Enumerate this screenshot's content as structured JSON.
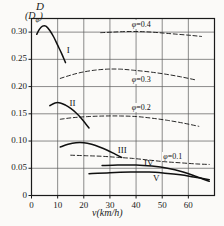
{
  "chart_data": {
    "type": "line",
    "title": "",
    "xlabel": "v(km/h)",
    "ylabel_top": "D",
    "ylabel_bottom": "(Dφ)",
    "xlim": [
      0,
      70
    ],
    "ylim": [
      0,
      0.325
    ],
    "grid": true,
    "legend": "inline-annotations",
    "xticks": [
      "0",
      "10",
      "20",
      "30",
      "40",
      "50",
      "60"
    ],
    "xtick_values": [
      0,
      10,
      20,
      30,
      40,
      50,
      60
    ],
    "yticks": [
      "0",
      "0.05",
      "0.10",
      "0.15",
      "0.20",
      "0.25",
      "0.30"
    ],
    "ytick_values": [
      0,
      0.05,
      0.1,
      0.15,
      0.2,
      0.25,
      0.3
    ],
    "series": [
      {
        "name": "I",
        "style": "solid",
        "label": "I",
        "points": [
          [
            2.0,
            0.296
          ],
          [
            3.0,
            0.305
          ],
          [
            4.2,
            0.311
          ],
          [
            5.5,
            0.311
          ],
          [
            7.0,
            0.303
          ],
          [
            8.5,
            0.291
          ],
          [
            10.0,
            0.276
          ],
          [
            11.5,
            0.261
          ],
          [
            13.0,
            0.244
          ]
        ]
      },
      {
        "name": "II",
        "style": "solid",
        "label": "II",
        "points": [
          [
            7.0,
            0.165
          ],
          [
            9.0,
            0.17
          ],
          [
            11.0,
            0.17
          ],
          [
            13.0,
            0.166
          ],
          [
            15.0,
            0.16
          ],
          [
            17.0,
            0.152
          ],
          [
            19.0,
            0.142
          ],
          [
            21.0,
            0.13
          ],
          [
            22.0,
            0.124
          ]
        ]
      },
      {
        "name": "III",
        "style": "solid",
        "label": "III",
        "points": [
          [
            11.0,
            0.089
          ],
          [
            14.0,
            0.094
          ],
          [
            17.0,
            0.097
          ],
          [
            20.0,
            0.097
          ],
          [
            23.0,
            0.094
          ],
          [
            26.0,
            0.089
          ],
          [
            29.0,
            0.083
          ],
          [
            32.0,
            0.076
          ],
          [
            34.5,
            0.07
          ]
        ]
      },
      {
        "name": "IV",
        "style": "solid",
        "label": "IV",
        "points": [
          [
            27.0,
            0.055
          ],
          [
            33.0,
            0.056
          ],
          [
            40.0,
            0.056
          ],
          [
            46.0,
            0.054
          ],
          [
            52.0,
            0.05
          ],
          [
            58.0,
            0.043
          ],
          [
            63.0,
            0.035
          ],
          [
            68.0,
            0.026
          ]
        ]
      },
      {
        "name": "V",
        "style": "solid",
        "label": "V",
        "points": [
          [
            22.0,
            0.04
          ],
          [
            30.0,
            0.042
          ],
          [
            38.0,
            0.043
          ],
          [
            45.0,
            0.043
          ],
          [
            51.0,
            0.041
          ],
          [
            57.0,
            0.038
          ],
          [
            62.0,
            0.034
          ],
          [
            68.0,
            0.029
          ]
        ]
      },
      {
        "name": "phi=0.4",
        "style": "dashed",
        "label": "φ=0.4",
        "points": [
          [
            26.5,
            0.299
          ],
          [
            31.0,
            0.3
          ],
          [
            36.0,
            0.301
          ],
          [
            41.0,
            0.301
          ],
          [
            46.0,
            0.3
          ],
          [
            51.0,
            0.298
          ],
          [
            56.0,
            0.296
          ],
          [
            61.0,
            0.294
          ],
          [
            65.0,
            0.292
          ]
        ]
      },
      {
        "name": "phi=0.3",
        "style": "dashed",
        "label": "φ=0.3",
        "points": [
          [
            11.0,
            0.215
          ],
          [
            15.0,
            0.221
          ],
          [
            19.0,
            0.226
          ],
          [
            24.0,
            0.23
          ],
          [
            29.0,
            0.232
          ],
          [
            34.0,
            0.232
          ],
          [
            39.0,
            0.23
          ],
          [
            45.0,
            0.227
          ],
          [
            51.0,
            0.223
          ],
          [
            57.0,
            0.218
          ],
          [
            63.0,
            0.212
          ]
        ]
      },
      {
        "name": "phi=0.2",
        "style": "dashed",
        "label": "φ=0.2",
        "points": [
          [
            11.0,
            0.14
          ],
          [
            16.0,
            0.143
          ],
          [
            22.0,
            0.145
          ],
          [
            28.0,
            0.146
          ],
          [
            34.0,
            0.146
          ],
          [
            40.0,
            0.145
          ],
          [
            46.0,
            0.142
          ],
          [
            52.0,
            0.138
          ],
          [
            58.0,
            0.133
          ],
          [
            64.0,
            0.127
          ]
        ]
      },
      {
        "name": "phi=0.1",
        "style": "dashed",
        "label": "φ=0.1",
        "points": [
          [
            15.0,
            0.074
          ],
          [
            21.0,
            0.073
          ],
          [
            27.0,
            0.072
          ],
          [
            33.0,
            0.07
          ],
          [
            39.0,
            0.068
          ],
          [
            45.0,
            0.065
          ],
          [
            51.0,
            0.062
          ],
          [
            57.0,
            0.06
          ],
          [
            63.0,
            0.058
          ],
          [
            68.0,
            0.057
          ]
        ]
      }
    ],
    "annotations": [
      {
        "text": "I",
        "x": 13.5,
        "y": 0.265
      },
      {
        "text": "II",
        "x": 14.5,
        "y": 0.168
      },
      {
        "text": "III",
        "x": 33.0,
        "y": 0.081
      },
      {
        "text": "IV",
        "x": 43.0,
        "y": 0.058
      },
      {
        "text": "V",
        "x": 46.5,
        "y": 0.03
      },
      {
        "text": "φ=0.4",
        "x": 38.0,
        "y": 0.312
      },
      {
        "text": "φ=0.3",
        "x": 38.0,
        "y": 0.211
      },
      {
        "text": "φ=0.2",
        "x": 38.0,
        "y": 0.158
      },
      {
        "text": "φ=0.1",
        "x": 50.0,
        "y": 0.069
      }
    ]
  },
  "axes": {
    "ylabel_top": "D",
    "ylabel_paren_open": "(D",
    "ylabel_sub": "φ",
    "ylabel_paren_close": ")",
    "xlabel": "v(km/h)"
  },
  "colors": {
    "background": "#fbfaf8",
    "axis": "#1a1a1a",
    "grid": "#5a5a5a",
    "curve": "#101010",
    "text": "#1a1a1a"
  }
}
